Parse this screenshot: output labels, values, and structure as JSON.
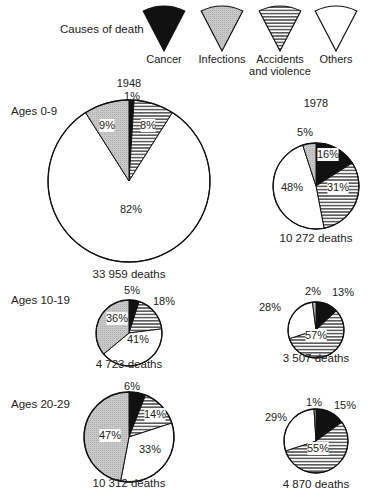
{
  "legend": {
    "title": "Causes of death",
    "items": [
      {
        "key": "cancer",
        "label": "Cancer",
        "label2": "",
        "fill": "black"
      },
      {
        "key": "infections",
        "label": "Infections",
        "label2": "",
        "fill": "grey"
      },
      {
        "key": "accidents",
        "label": "Accidents",
        "label2": "and violence",
        "fill": "stripes"
      },
      {
        "key": "others",
        "label": "Others",
        "label2": "",
        "fill": "white"
      }
    ]
  },
  "year_labels": {
    "y1948": "1948",
    "y1978": "1978"
  },
  "age_labels": {
    "a0": "Ages 0-9",
    "a10": "Ages 10-19",
    "a20": "Ages 20-29"
  },
  "chart_data": {
    "type": "pie",
    "legend": [
      "Cancer",
      "Infections",
      "Accidents and violence",
      "Others"
    ],
    "slice_order_clockwise_from_top": [
      "Cancer",
      "Accidents and violence",
      "Others",
      "Infections"
    ],
    "charts": [
      {
        "age": "Ages 0-9",
        "year": "1948",
        "total_deaths": "33 959 deaths",
        "values": {
          "Cancer": 1,
          "Accidents and violence": 8,
          "Others": 82,
          "Infections": 9
        }
      },
      {
        "age": "Ages 0-9",
        "year": "1978",
        "total_deaths": "10 272 deaths",
        "values": {
          "Cancer": 16,
          "Accidents and violence": 31,
          "Others": 48,
          "Infections": 5
        }
      },
      {
        "age": "Ages 10-19",
        "year": "1948",
        "total_deaths": "4 723 deaths",
        "values": {
          "Cancer": 5,
          "Accidents and violence": 18,
          "Others": 41,
          "Infections": 36
        }
      },
      {
        "age": "Ages 10-19",
        "year": "1978",
        "total_deaths": "3 507 deaths",
        "values": {
          "Cancer": 13,
          "Accidents and violence": 57,
          "Others": 28,
          "Infections": 2
        }
      },
      {
        "age": "Ages 20-29",
        "year": "1948",
        "total_deaths": "10 312 deaths",
        "values": {
          "Cancer": 6,
          "Accidents and violence": 14,
          "Others": 33,
          "Infections": 47
        }
      },
      {
        "age": "Ages 20-29",
        "year": "1978",
        "total_deaths": "4 870 deaths",
        "values": {
          "Cancer": 15,
          "Accidents and violence": 55,
          "Others": 29,
          "Infections": 1
        }
      }
    ]
  }
}
